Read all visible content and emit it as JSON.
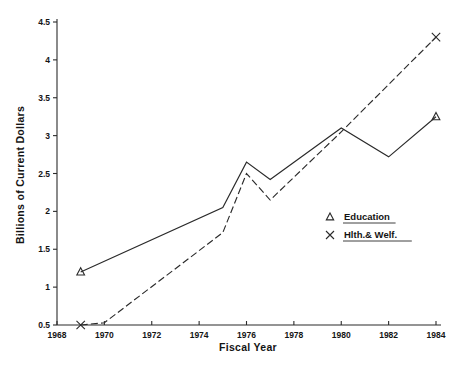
{
  "chart_data": {
    "type": "line",
    "title": "",
    "xlabel": "Fiscal Year",
    "ylabel": "Billions of Current Dollars",
    "xlim": [
      1968,
      1984
    ],
    "ylim": [
      0.5,
      4.5
    ],
    "xticks": [
      1968,
      1970,
      1972,
      1974,
      1976,
      1978,
      1980,
      1982,
      1984
    ],
    "xticklabels": [
      "1968",
      "1970",
      "1972",
      "1974",
      "1976",
      "1978",
      "1980",
      "1982",
      "1984"
    ],
    "yticks": [
      0.5,
      1,
      1.5,
      2,
      2.5,
      3,
      3.5,
      4,
      4.5
    ],
    "yticklabels": [
      "0.5",
      "1",
      "1.5",
      "2",
      "2.5",
      "3",
      "3.5",
      "4",
      "4.5"
    ],
    "grid": false,
    "legend_position": "center-right",
    "series": [
      {
        "name": "Education",
        "marker": "triangle",
        "linestyle": "solid",
        "color": "#2a2a2a",
        "x": [
          1969,
          1975,
          1976,
          1977,
          1980,
          1982,
          1984
        ],
        "values": [
          1.2,
          2.05,
          2.65,
          2.42,
          3.1,
          2.72,
          3.25
        ],
        "marker_points": [
          [
            1969,
            1.2
          ],
          [
            1984,
            3.25
          ]
        ]
      },
      {
        "name": "Hlth.& Welf.",
        "marker": "x",
        "linestyle": "dashed",
        "color": "#2a2a2a",
        "x": [
          1969,
          1970,
          1975,
          1976,
          1977,
          1980,
          1984
        ],
        "values": [
          0.5,
          0.53,
          1.72,
          2.5,
          2.15,
          3.05,
          4.3
        ],
        "marker_points": [
          [
            1969,
            0.5
          ],
          [
            1984,
            4.3
          ]
        ]
      }
    ]
  },
  "legend": {
    "items": [
      {
        "label": "Education",
        "marker": "triangle"
      },
      {
        "label": "Hlth.& Welf.",
        "marker": "x"
      }
    ]
  },
  "axes": {
    "x_title": "Fiscal Year",
    "y_title": "Billions of Current Dollars"
  }
}
